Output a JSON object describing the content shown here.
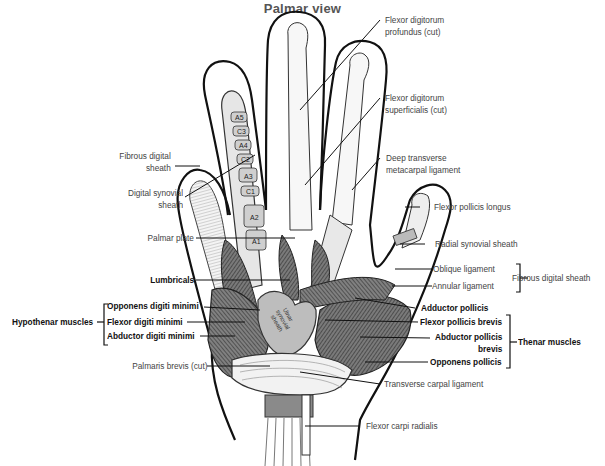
{
  "title": "Palmar view",
  "labels": {
    "fdp": [
      "Flexor digitorum",
      "profundus (cut)"
    ],
    "fds": [
      "Flexor digitorum",
      "superficialis (cut)"
    ],
    "dtml": [
      "Deep transverse",
      "metacarpal ligament"
    ],
    "fpl": "Flexor pollicis longus",
    "rss": "Radial synovial sheath",
    "oblique": "Oblique ligament",
    "annular": "Annular ligament",
    "fds_group": "Fibrous digital sheath",
    "add_poll": "Adductor pollicis",
    "fpb": "Flexor pollicis brevis",
    "apb": [
      "Abductor pollicis",
      "brevis"
    ],
    "op": "Opponens pollicis",
    "thenar": "Thenar muscles",
    "tcl": "Transverse carpal ligament",
    "fcr": "Flexor carpi radialis",
    "fibrous": [
      "Fibrous digital",
      "sheath"
    ],
    "dss": [
      "Digital synovial",
      "sheath"
    ],
    "palmar_plate": "Palmar plate",
    "lumbricals": "Lumbricals",
    "odm": "Opponens digiti minimi",
    "fdm": "Flexor digiti minimi",
    "adm": "Abductor digiti minimi",
    "hypothenar": "Hypothenar muscles",
    "pb": "Palmaris brevis (cut)",
    "ulnar_sheath": [
      "Ulnar",
      "synovial",
      "sheath"
    ]
  },
  "pulleys": [
    "A5",
    "C3",
    "A4",
    "C2",
    "A3",
    "C1",
    "A2",
    "A1"
  ],
  "colors": {
    "ink": "#111111",
    "muscle": "#6b6b6b",
    "muscle_dark": "#3d3d3d",
    "sheath": "#d9d9d9",
    "text": "#444444"
  }
}
